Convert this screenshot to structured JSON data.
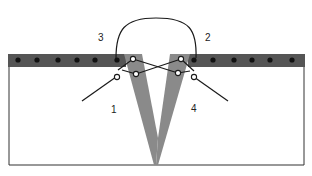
{
  "diagram": {
    "labels": [
      {
        "id": "3",
        "text": "3",
        "x": 98,
        "y": 33
      },
      {
        "id": "2",
        "text": "2",
        "x": 205,
        "y": 33
      },
      {
        "id": "1",
        "text": "1",
        "x": 111,
        "y": 105
      },
      {
        "id": "4",
        "text": "4",
        "x": 191,
        "y": 104
      }
    ],
    "colors": {
      "bar": "#555555",
      "dot": "#111111",
      "wedge": "#8a8a8a",
      "outline": "#333333",
      "thread": "#1a1a1a",
      "background": "#ffffff"
    }
  }
}
